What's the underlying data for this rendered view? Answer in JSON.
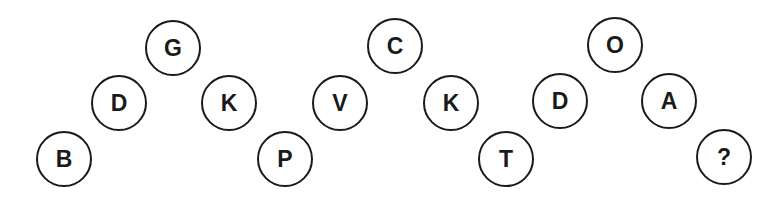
{
  "puzzle": {
    "type": "letter-sequence",
    "groups": [
      {
        "nodes": [
          {
            "letter": "B",
            "x": 63,
            "y": 158
          },
          {
            "letter": "D",
            "x": 118,
            "y": 102
          },
          {
            "letter": "G",
            "x": 172,
            "y": 47
          },
          {
            "letter": "K",
            "x": 228,
            "y": 102
          }
        ]
      },
      {
        "nodes": [
          {
            "letter": "P",
            "x": 284,
            "y": 158
          },
          {
            "letter": "V",
            "x": 339,
            "y": 102
          },
          {
            "letter": "C",
            "x": 394,
            "y": 45
          },
          {
            "letter": "K",
            "x": 450,
            "y": 102
          }
        ]
      },
      {
        "nodes": [
          {
            "letter": "T",
            "x": 505,
            "y": 158
          },
          {
            "letter": "D",
            "x": 559,
            "y": 100
          },
          {
            "letter": "O",
            "x": 614,
            "y": 44
          },
          {
            "letter": "A",
            "x": 668,
            "y": 100
          },
          {
            "letter": "?",
            "x": 723,
            "y": 156
          }
        ]
      }
    ]
  }
}
